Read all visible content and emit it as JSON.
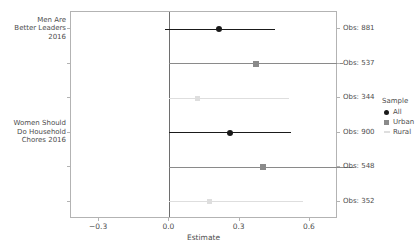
{
  "chart_data": {
    "type": "scatter",
    "title": "",
    "xlabel": "Estimate",
    "ylabel": "",
    "xlim": [
      -0.42,
      0.72
    ],
    "xticks": [
      -0.3,
      0.0,
      0.3,
      0.6
    ],
    "xtick_labels": [
      "−0.3",
      "0.0",
      "0.3",
      "0.6"
    ],
    "grid": false,
    "legend_position": "right",
    "zero_reference_line": 0.0,
    "legend": {
      "title": "Sample",
      "entries": [
        {
          "name": "All",
          "marker": "circle",
          "color": "#1a1a1a"
        },
        {
          "name": "Urban",
          "marker": "square",
          "color": "#8a8a8a"
        },
        {
          "name": "Rural",
          "marker": "line",
          "color": "#dedede"
        }
      ]
    },
    "group_labels": [
      "Men Are\nBetter Leaders\n2016",
      "Women Should\nDo Household\nChores 2016"
    ],
    "points": [
      {
        "group": "Men Are Better Leaders 2016",
        "sample": "All",
        "estimate": 0.21,
        "ci_low": -0.02,
        "ci_high": 0.45,
        "obs_label": "Obs: 881",
        "obs": 881,
        "color": "#1a1a1a"
      },
      {
        "group": "Men Are Better Leaders 2016",
        "sample": "Urban",
        "estimate": 0.37,
        "ci_low": 0.0,
        "ci_high": 0.74,
        "obs_label": "Obs: 537",
        "obs": 537,
        "color": "#8a8a8a"
      },
      {
        "group": "Men Are Better Leaders 2016",
        "sample": "Rural",
        "estimate": 0.12,
        "ci_low": 0.0,
        "ci_high": 0.51,
        "obs_label": "Obs: 344",
        "obs": 344,
        "color": "#dedede"
      },
      {
        "group": "Women Should Do Household Chores 2016",
        "sample": "All",
        "estimate": 0.26,
        "ci_low": 0.0,
        "ci_high": 0.52,
        "obs_label": "Obs: 900",
        "obs": 900,
        "color": "#1a1a1a"
      },
      {
        "group": "Women Should Do Household Chores 2016",
        "sample": "Urban",
        "estimate": 0.4,
        "ci_low": 0.0,
        "ci_high": 0.79,
        "obs_label": "Obs: 548",
        "obs": 548,
        "color": "#8a8a8a"
      },
      {
        "group": "Women Should Do Household Chores 2016",
        "sample": "Rural",
        "estimate": 0.17,
        "ci_low": 0.0,
        "ci_high": 0.57,
        "obs_label": "Obs: 352",
        "obs": 352,
        "color": "#dedede"
      }
    ]
  },
  "y_labels": [
    {
      "lines": [
        "Men Are",
        "Better Leaders",
        "2016"
      ]
    },
    {
      "lines": [
        "Women Should",
        "Do Household",
        "Chores 2016"
      ]
    }
  ],
  "axis": {
    "x_title": "Estimate",
    "x_tick_labels": [
      "−0.3",
      "0.0",
      "0.3",
      "0.6"
    ]
  },
  "legend": {
    "title": "Sample",
    "items": [
      "All",
      "Urban",
      "Rural"
    ]
  },
  "obs_labels": [
    "Obs: 881",
    "Obs: 537",
    "Obs: 344",
    "Obs: 900",
    "Obs: 548",
    "Obs: 352"
  ],
  "title": ""
}
